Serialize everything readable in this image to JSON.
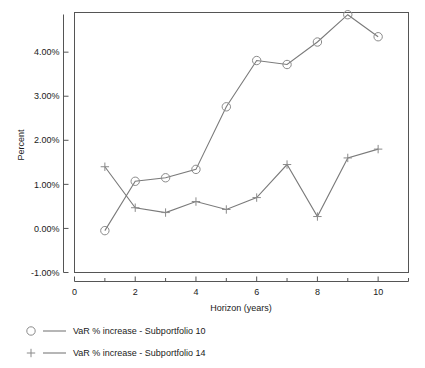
{
  "chart_data": {
    "type": "line",
    "title": "",
    "xlabel": "Horizon (years)",
    "ylabel": "Percent",
    "xlim": [
      0,
      11
    ],
    "ylim": [
      -1.0,
      4.9
    ],
    "grid": false,
    "legend_position": "below-left",
    "x": [
      1,
      2,
      3,
      4,
      5,
      6,
      7,
      8,
      9,
      10
    ],
    "xticks": [
      0,
      2,
      4,
      6,
      8,
      10
    ],
    "xticklabels": [
      "0",
      "2",
      "4",
      "6",
      "8",
      "10"
    ],
    "xminorticks": [
      1,
      3,
      5,
      7,
      9,
      11
    ],
    "yticks": [
      -1.0,
      0.0,
      1.0,
      2.0,
      3.0,
      4.0
    ],
    "yticklabels": [
      "-1.00%",
      "0.00%",
      "1.00%",
      "2.00%",
      "3.00%",
      "4.00%"
    ],
    "series": [
      {
        "name": "VaR % increase - Subportfolio 10",
        "marker": "circle",
        "color": "#7a7a7a",
        "values": [
          -0.05,
          1.07,
          1.15,
          1.34,
          2.76,
          3.81,
          3.72,
          4.23,
          4.85,
          4.35
        ]
      },
      {
        "name": "VaR % increase - Subportfolio 14",
        "marker": "plus",
        "color": "#7a7a7a",
        "values": [
          1.4,
          0.47,
          0.36,
          0.61,
          0.43,
          0.7,
          1.45,
          0.27,
          1.6,
          1.8
        ]
      }
    ]
  },
  "legend": {
    "entries": [
      {
        "label": "VaR % increase - Subportfolio 10",
        "marker": "circle-marker"
      },
      {
        "label": "VaR % increase - Subportfolio 14",
        "marker": "plus-marker"
      }
    ]
  }
}
